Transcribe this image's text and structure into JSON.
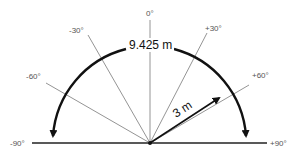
{
  "diagram": {
    "angle_labels": [
      "-90°",
      "-60°",
      "-30°",
      "0°",
      "+30°",
      "+60°",
      "+90°"
    ],
    "arc_length_label": "9.425 m",
    "radius_label": "3 m",
    "colors": {
      "arc": "#111111",
      "rays": "#888888",
      "baseline": "#222222",
      "labels": "#555555"
    }
  }
}
